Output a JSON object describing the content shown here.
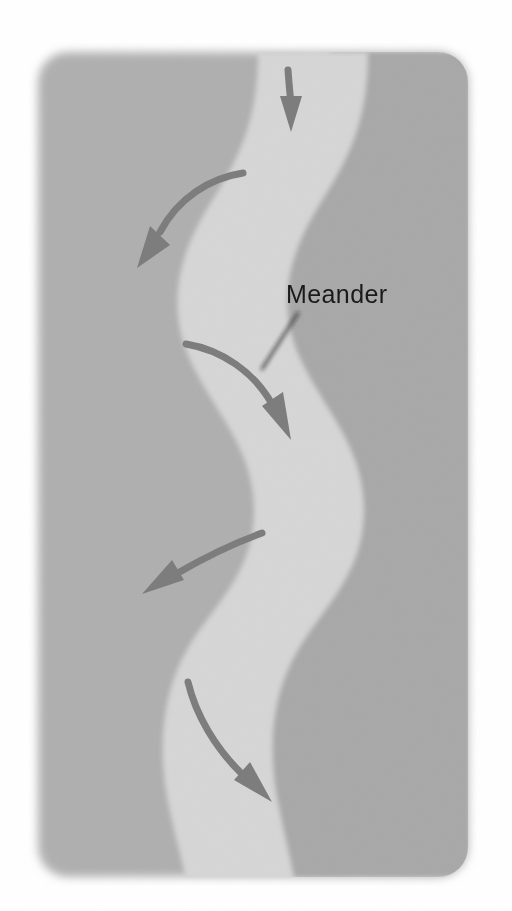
{
  "page": {
    "background_color": "#ffffff",
    "width": 512,
    "height": 911
  },
  "figure": {
    "name": "river-meander-diagram",
    "card": {
      "background_color": "#b0b0b0",
      "x": 38,
      "y": 52,
      "width": 430,
      "height": 825,
      "corner_radius": 30
    },
    "river": {
      "name": "river-channel",
      "fill_color": "#d4d4d4",
      "shadow_color": "#a8a8a8",
      "description": "meandering river channel"
    },
    "arrows": {
      "color": "#7d7d7d",
      "count": 5,
      "items": [
        {
          "id": "flow-arrow-1",
          "direction": "down"
        },
        {
          "id": "flow-arrow-2",
          "direction": "down-left"
        },
        {
          "id": "flow-arrow-3",
          "direction": "down-right"
        },
        {
          "id": "flow-arrow-4",
          "direction": "down-left"
        },
        {
          "id": "flow-arrow-5",
          "direction": "down-right"
        }
      ]
    },
    "annotation": {
      "label": "Meander",
      "text_color": "#1a1a1a",
      "leader_line_color": "#1a1a1a",
      "label_x": 286,
      "label_y": 303
    }
  }
}
